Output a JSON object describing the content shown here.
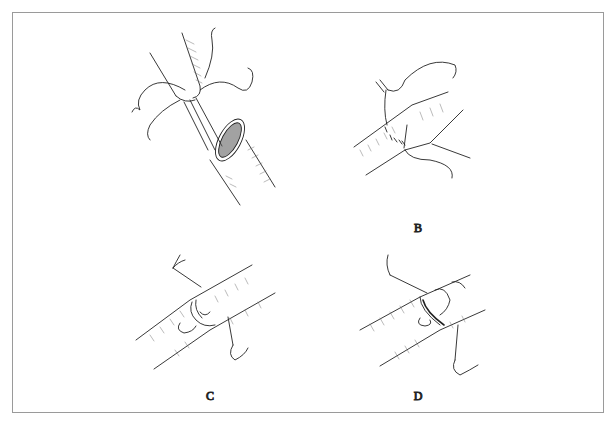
{
  "figure": {
    "panels": [
      {
        "id": "A",
        "label": "A",
        "content": "Small vessel inserted into oval opening of larger vessel with stay sutures"
      },
      {
        "id": "B",
        "label": "B",
        "content": "Interrupted sutures placed along anastomosis line"
      },
      {
        "id": "C",
        "label": "C",
        "content": "Vessels joined end-to-end with traction sutures held by forceps"
      },
      {
        "id": "D",
        "label": "D",
        "content": "Completion of anastomosis with traction sutures"
      }
    ],
    "colors": {
      "ink": "#222222",
      "hatch": "#777777",
      "frame": "#9a9a9a",
      "background": "#ffffff"
    }
  }
}
